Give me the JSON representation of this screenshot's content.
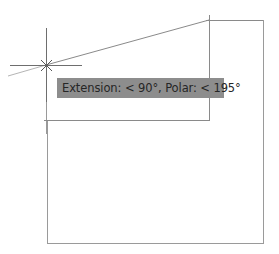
{
  "viewport": {
    "background": "#ffffff",
    "line_color": "#8a8a8a",
    "tracking_line_color": "#a8a8a8"
  },
  "crosshair": {
    "x": 46,
    "y": 65,
    "color": "#6a6a6a"
  },
  "tooltip": {
    "text": "Extension: < 90°,  Polar: < 195°",
    "background": "#8d8d8d",
    "text_color": "#262626"
  },
  "geometry": {
    "polyline_top": [
      [
        46,
        65
      ],
      [
        209,
        20
      ],
      [
        263,
        20
      ],
      [
        263,
        243
      ],
      [
        47,
        243
      ],
      [
        47,
        120
      ],
      [
        209,
        120
      ],
      [
        209,
        20
      ]
    ]
  }
}
